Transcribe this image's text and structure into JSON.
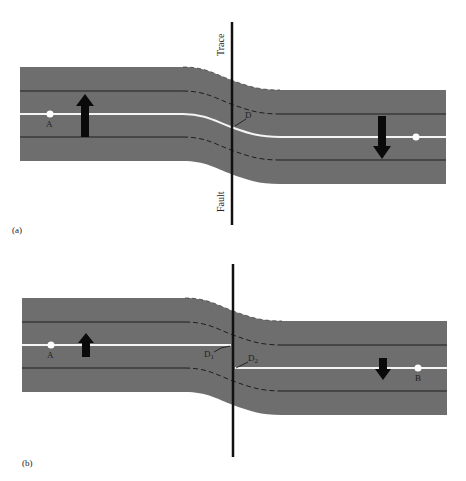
{
  "colors": {
    "road": "#6e6e6e",
    "lane_line": "#1e1e1e",
    "center_line": "#f4f4f4",
    "fault": "#111111",
    "arrow": "#0a0a0a",
    "background": "#ffffff"
  },
  "panel_a": {
    "label": "(a)",
    "fault_label_top": "Trace",
    "fault_label_bottom": "Fault",
    "point_left": "A",
    "displacement_label": "D"
  },
  "panel_b": {
    "label": "(b)",
    "point_left": "A",
    "point_right": "B",
    "displacement_left": "D",
    "displacement_left_sub": "1",
    "displacement_right": "D",
    "displacement_right_sub": "2"
  }
}
